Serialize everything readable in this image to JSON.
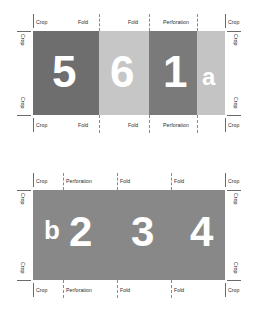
{
  "diagram": {
    "colors": {
      "background": "#ffffff",
      "mark_line": "#8a8a8a",
      "crop_line": "#6a6a6a",
      "label_text": "#2b2b2b",
      "glyph": "#ffffff"
    }
  },
  "sheets": [
    {
      "name": "front-sheet",
      "segments": [
        {
          "glyph": "5",
          "color": "#6e6e6e",
          "width": 66
        },
        {
          "glyph": "6",
          "color": "#c6c6c6",
          "width": 50
        },
        {
          "glyph": "1",
          "color": "#7a7a7a",
          "width": 48
        },
        {
          "glyph": "a",
          "color": "#c4c4c4",
          "width": 28
        }
      ],
      "top_labels": [
        "Crop",
        "Fold",
        "Fold",
        "Perforation",
        "Crop"
      ],
      "bottom_labels": [
        "Crop",
        "Fold",
        "Fold",
        "Perforation",
        "Crop"
      ],
      "left_labels": [
        "Crop",
        "Crop"
      ],
      "right_labels": [
        "Crop",
        "Crop"
      ]
    },
    {
      "name": "back-sheet",
      "segments": [
        {
          "glyph": "b",
          "color": "#888888",
          "width": 30
        },
        {
          "glyph": "2",
          "color": "#888888",
          "width": 54
        },
        {
          "glyph": "3",
          "color": "#888888",
          "width": 54
        },
        {
          "glyph": "4",
          "color": "#888888",
          "width": 54
        }
      ],
      "top_labels": [
        "Crop",
        "Perforation",
        "Fold",
        "Fold",
        "Crop"
      ],
      "bottom_labels": [
        "Crop",
        "Perforation",
        "Fold",
        "Fold",
        "Crop"
      ],
      "left_labels": [
        "Crop",
        "Crop"
      ],
      "right_labels": [
        "Crop",
        "Crop"
      ]
    }
  ]
}
